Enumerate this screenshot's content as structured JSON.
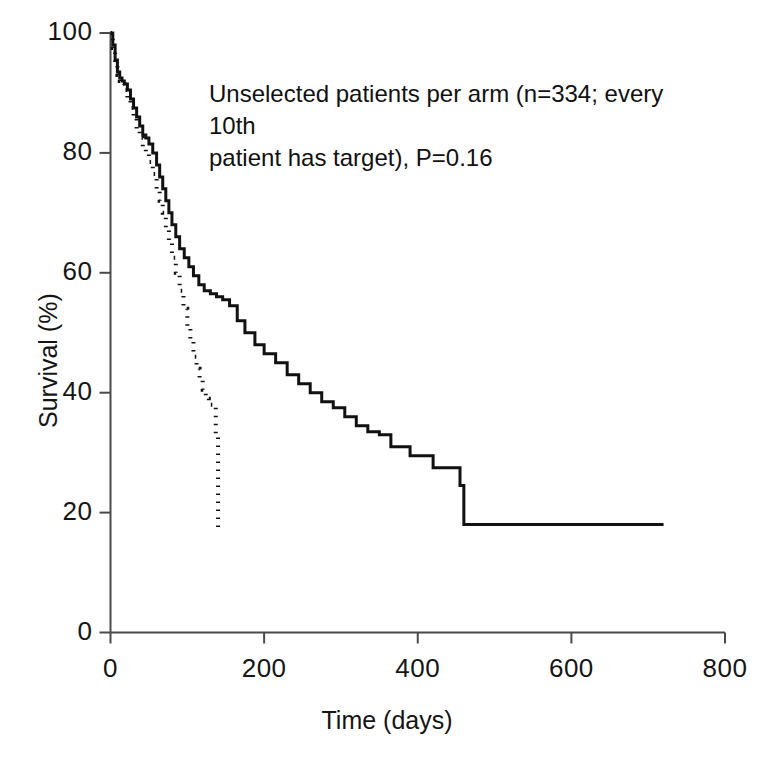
{
  "chart_data": {
    "type": "line",
    "title": "",
    "subtitle": "",
    "xlabel": "Time (days)",
    "ylabel": "Survival (%)",
    "xlim": [
      0,
      800
    ],
    "ylim": [
      0,
      100
    ],
    "xticks": [
      0,
      200,
      400,
      600,
      800
    ],
    "yticks": [
      0,
      20,
      40,
      60,
      80,
      100
    ],
    "xtick_labels": [
      "0",
      "200",
      "400",
      "600",
      "800"
    ],
    "ytick_labels": [
      "0",
      "20",
      "40",
      "60",
      "80",
      "100"
    ],
    "grid": false,
    "legend": "none",
    "step_style": "post",
    "annotations": [
      {
        "name": "study-annotation",
        "text_line_1": "Unselected patients per arm (n=334; every 10th",
        "text_line_2": "patient has target), P=0.16",
        "full_text": "Unselected patients per arm (n=334; every 10th patient has target), P=0.16"
      }
    ],
    "series": [
      {
        "name": "solid-arm",
        "style": "solid",
        "color": "#111111",
        "x": [
          0,
          3,
          6,
          9,
          12,
          15,
          18,
          22,
          26,
          30,
          34,
          38,
          42,
          46,
          50,
          55,
          60,
          64,
          68,
          72,
          76,
          80,
          85,
          90,
          96,
          102,
          108,
          115,
          122,
          130,
          138,
          146,
          155,
          165,
          175,
          188,
          200,
          215,
          230,
          245,
          260,
          275,
          290,
          305,
          320,
          335,
          350,
          365,
          390,
          420,
          455,
          460,
          720
        ],
        "y": [
          100,
          98,
          95.5,
          93.5,
          92.5,
          92,
          91.5,
          90.5,
          89,
          87.5,
          86,
          84.5,
          83,
          82.5,
          81.5,
          80,
          78,
          76,
          74,
          72,
          70,
          68,
          66,
          64,
          62.5,
          61,
          59.5,
          58,
          57,
          56.5,
          56,
          55.5,
          54.5,
          52,
          50,
          48,
          46.5,
          45,
          43,
          41.5,
          40,
          38.5,
          37.5,
          36,
          34.5,
          33.5,
          33,
          31,
          29.5,
          27.5,
          24.5,
          18,
          18
        ]
      },
      {
        "name": "dotted-arm",
        "style": "dotted",
        "color": "#111111",
        "x": [
          0,
          3,
          6,
          9,
          12,
          15,
          18,
          22,
          26,
          30,
          34,
          38,
          42,
          46,
          50,
          55,
          60,
          64,
          68,
          72,
          76,
          80,
          85,
          90,
          95,
          100,
          104,
          108,
          112,
          116,
          120,
          124,
          128,
          133,
          137,
          140
        ],
        "y": [
          100,
          97.5,
          95,
          93,
          92,
          91.5,
          90.5,
          89,
          87.5,
          86,
          84,
          82.5,
          81,
          80,
          78.5,
          76.5,
          74,
          72,
          70,
          67.5,
          65,
          62.5,
          60,
          57,
          54,
          51,
          48.5,
          46,
          44,
          42,
          40.5,
          39,
          38,
          38,
          33,
          33
        ],
        "terminal_drop_to": 16.5,
        "terminal_x": 140
      }
    ]
  },
  "axes": {
    "x_title": "Time (days)",
    "y_title": "Survival (%)"
  }
}
